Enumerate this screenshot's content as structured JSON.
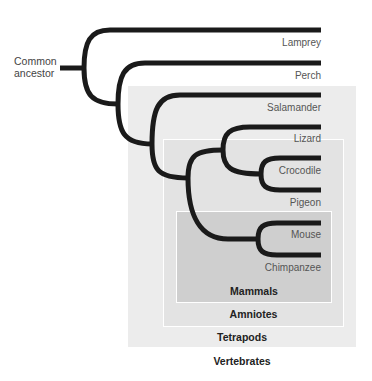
{
  "diagram": {
    "type": "phylogenetic-tree",
    "root_label": [
      "Common",
      "ancestor"
    ],
    "taxa": [
      {
        "label": "Lamprey",
        "y": 30
      },
      {
        "label": "Perch",
        "y": 63
      },
      {
        "label": "Salamander",
        "y": 95
      },
      {
        "label": "Lizard",
        "y": 127
      },
      {
        "label": "Crocodile",
        "y": 158
      },
      {
        "label": "Pigeon",
        "y": 190
      },
      {
        "label": "Mouse",
        "y": 223
      },
      {
        "label": "Chimpanzee",
        "y": 255
      }
    ],
    "clades": [
      {
        "label": "Mammals",
        "members": [
          "Mouse",
          "Chimpanzee"
        ],
        "color": "#cfcfcf"
      },
      {
        "label": "Amniotes",
        "members": [
          "Lizard",
          "Crocodile",
          "Pigeon",
          "Mouse",
          "Chimpanzee"
        ],
        "color": "#e3e3e3"
      },
      {
        "label": "Tetrapods",
        "members": [
          "Salamander",
          "Lizard",
          "Crocodile",
          "Pigeon",
          "Mouse",
          "Chimpanzee"
        ],
        "color": "#ececec"
      },
      {
        "label": "Vertebrates",
        "members": [
          "Lamprey",
          "Perch",
          "Salamander",
          "Lizard",
          "Crocodile",
          "Pigeon",
          "Mouse",
          "Chimpanzee"
        ],
        "color": "#ffffff"
      }
    ],
    "colors": {
      "branch": "#1a1a1a",
      "leaf_text": "#555555",
      "clade_text": "#222222"
    }
  }
}
